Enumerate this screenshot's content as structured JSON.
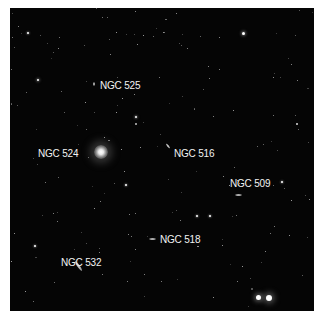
{
  "image": {
    "description": "Deep-sky field of the NGC 524 galaxy group",
    "background": "#050505",
    "label_color": "#f2f2f2"
  },
  "galaxies": [
    {
      "name": "NGC 525",
      "label_x": 90,
      "label_y": 73,
      "gx": 84,
      "gy": 76,
      "w": 2,
      "h": 4,
      "angle": 0
    },
    {
      "name": "NGC 524",
      "label_x": 28,
      "label_y": 141,
      "gx": 91,
      "gy": 144,
      "w": 14,
      "h": 14,
      "angle": 0
    },
    {
      "name": "NGC 516",
      "label_x": 164,
      "label_y": 141,
      "gx": 158,
      "gy": 138,
      "w": 2,
      "h": 6,
      "angle": -40
    },
    {
      "name": "NGC 509",
      "label_x": 220,
      "label_y": 171,
      "gx": 228,
      "gy": 187,
      "w": 7,
      "h": 2,
      "angle": 0
    },
    {
      "name": "NGC 518",
      "label_x": 150,
      "label_y": 227,
      "gx": 142,
      "gy": 231,
      "w": 7,
      "h": 2,
      "angle": 0
    },
    {
      "name": "NGC 532",
      "label_x": 51,
      "label_y": 250,
      "gx": 68,
      "gy": 258,
      "w": 3,
      "h": 12,
      "angle": -35
    }
  ],
  "bright_stars": [
    {
      "x": 248,
      "y": 289,
      "r": 2.5
    },
    {
      "x": 259,
      "y": 290,
      "r": 3.2
    },
    {
      "x": 233,
      "y": 25,
      "r": 1.5
    },
    {
      "x": 28,
      "y": 72,
      "r": 1.3
    },
    {
      "x": 126,
      "y": 109,
      "r": 1.1
    },
    {
      "x": 18,
      "y": 25,
      "r": 1.0
    },
    {
      "x": 116,
      "y": 177,
      "r": 1.0
    },
    {
      "x": 25,
      "y": 238,
      "r": 1.0
    },
    {
      "x": 272,
      "y": 174,
      "r": 1.0
    },
    {
      "x": 187,
      "y": 208,
      "r": 1.0
    },
    {
      "x": 200,
      "y": 208,
      "r": 1.0
    }
  ]
}
